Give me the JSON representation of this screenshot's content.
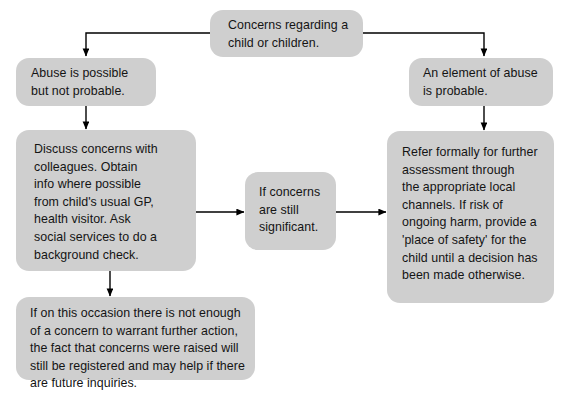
{
  "diagram": {
    "background_color": "#ffffff",
    "node_fill_color": "#cfcfcf",
    "text_color": "#141414",
    "connector_color": "#000000",
    "nodes": [
      {
        "id": "concerns",
        "text": "Concerns regarding a\nchild or children."
      },
      {
        "id": "abuse-possible",
        "text": "Abuse is possible\nbut not probable."
      },
      {
        "id": "abuse-probable",
        "text": "An element of abuse\nis probable."
      },
      {
        "id": "discuss-concerns",
        "text": "Discuss concerns with\ncolleagues.  Obtain\ninfo where possible\nfrom child's usual GP,\nhealth visitor.  Ask\nsocial services to do a\nbackground check."
      },
      {
        "id": "still-significant",
        "text": "If concerns\nare still\nsignificant."
      },
      {
        "id": "refer-formally",
        "text": "Refer formally for further\nassessment through\nthe appropriate local\nchannels.  If risk of\nongoing harm, provide a\n'place of safety' for the\nchild until a decision has\nbeen made otherwise."
      },
      {
        "id": "not-enough-concern",
        "text": "If on this occasion there is not enough\nof a concern to warrant further action,\nthe fact that concerns were raised will\nstill be registered and may help if there\nare future inquiries."
      }
    ],
    "connectors": [
      {
        "id": "concerns-to-abuse-possible",
        "from": "concerns",
        "to": "abuse-possible"
      },
      {
        "id": "concerns-to-abuse-probable",
        "from": "concerns",
        "to": "abuse-probable"
      },
      {
        "id": "abuse-possible-to-discuss",
        "from": "abuse-possible",
        "to": "discuss-concerns"
      },
      {
        "id": "abuse-probable-to-refer",
        "from": "abuse-probable",
        "to": "refer-formally"
      },
      {
        "id": "discuss-to-significant",
        "from": "discuss-concerns",
        "to": "still-significant"
      },
      {
        "id": "significant-to-refer",
        "from": "still-significant",
        "to": "refer-formally"
      },
      {
        "id": "discuss-to-not-enough",
        "from": "discuss-concerns",
        "to": "not-enough-concern"
      }
    ]
  }
}
